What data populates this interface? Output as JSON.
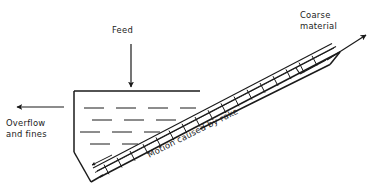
{
  "diagram": {
    "type": "line-drawing",
    "background_color": "#ffffff",
    "line_color": "#1a1a1a",
    "labels": {
      "feed": "Feed",
      "coarse_material_line1": "Coarse",
      "coarse_material_line2": "material",
      "overflow_line1": "Overflow",
      "overflow_line2": "and fines",
      "motion": "Motion caused by rake"
    },
    "arrows": {
      "feed": {
        "direction": "down",
        "from": [
          131,
          44
        ],
        "to": [
          131,
          88
        ]
      },
      "coarse_material": {
        "direction": "up-right",
        "from": [
          327,
          60
        ],
        "to": [
          365,
          36
        ]
      },
      "overflow": {
        "direction": "left",
        "from": [
          64,
          107
        ],
        "to": [
          18,
          107
        ]
      },
      "rake_motion": {
        "direction": "down-left",
        "from": [
          108,
          157
        ],
        "to": [
          88,
          166
        ]
      }
    },
    "tank": {
      "outline_points": "74,91 200,91 74,91 74,152 90,182 200,91",
      "top_edge_y": 91,
      "left_wall_x": 74,
      "bottom_vertex": [
        90,
        182
      ]
    },
    "trough": {
      "description": "inclined rectangular trough rising to upper right",
      "angle_deg": -26.5,
      "upper_end": [
        338,
        46
      ],
      "lower_end": [
        90,
        178
      ]
    },
    "liquid": {
      "description": "staggered horizontal dashes indicating pulp level",
      "dash_rows": 4,
      "dash_color": "#1a1a1a"
    },
    "rake": {
      "description": "raking mechanism with flights along trough floor",
      "teeth_count": 17
    }
  }
}
